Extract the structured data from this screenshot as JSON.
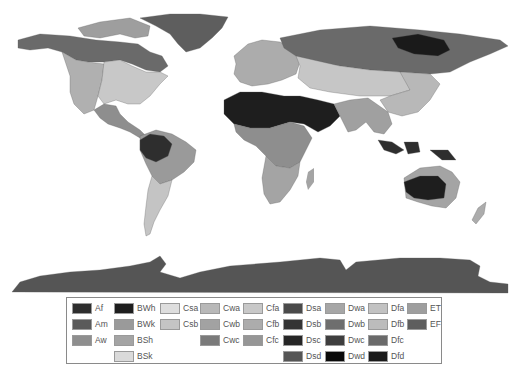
{
  "figure": {
    "caption": ""
  },
  "legend": {
    "columns": [
      [
        {
          "code": "Af",
          "color": "#2e2e2e"
        },
        {
          "code": "Am",
          "color": "#5a5a5a"
        },
        {
          "code": "Aw",
          "color": "#8e8e8e"
        }
      ],
      [
        {
          "code": "BWh",
          "color": "#1e1e1e"
        },
        {
          "code": "BWk",
          "color": "#9a9a9a"
        },
        {
          "code": "BSh",
          "color": "#a4a4a4"
        },
        {
          "code": "BSk",
          "color": "#dadada"
        }
      ],
      [
        {
          "code": "Csa",
          "color": "#dedede"
        },
        {
          "code": "Csb",
          "color": "#c4c4c4"
        }
      ],
      [
        {
          "code": "Cwa",
          "color": "#b8b8b8"
        },
        {
          "code": "Cwb",
          "color": "#a2a2a2"
        },
        {
          "code": "Cwc",
          "color": "#7a7a7a"
        }
      ],
      [
        {
          "code": "Cfa",
          "color": "#c8c8c8"
        },
        {
          "code": "Cfb",
          "color": "#acacac"
        },
        {
          "code": "Cfc",
          "color": "#969696"
        }
      ],
      [
        {
          "code": "Dsa",
          "color": "#4a4a4a"
        },
        {
          "code": "Dsb",
          "color": "#343434"
        },
        {
          "code": "Dsc",
          "color": "#262626"
        },
        {
          "code": "Dsd",
          "color": "#565656"
        }
      ],
      [
        {
          "code": "Dwa",
          "color": "#a6a6a6"
        },
        {
          "code": "Dwb",
          "color": "#6e6e6e"
        },
        {
          "code": "Dwc",
          "color": "#3e3e3e"
        },
        {
          "code": "Dwd",
          "color": "#0a0a0a"
        }
      ],
      [
        {
          "code": "Dfa",
          "color": "#c2c2c2"
        },
        {
          "code": "Dfb",
          "color": "#bcbcbc"
        },
        {
          "code": "Dfc",
          "color": "#6a6a6a"
        },
        {
          "code": "Dfd",
          "color": "#1a1a1a"
        }
      ],
      [
        {
          "code": "ET",
          "color": "#9e9e9e"
        },
        {
          "code": "EF",
          "color": "#5e5e5e"
        }
      ]
    ]
  },
  "regions": [
    {
      "name": "greenland",
      "class": "EF",
      "color": "#5e5e5e"
    },
    {
      "name": "antarctica",
      "class": "EF",
      "color": "#555555"
    },
    {
      "name": "north-america-boreal",
      "class": "Dfc",
      "color": "#6a6a6a"
    },
    {
      "name": "north-america-arctic",
      "class": "ET",
      "color": "#9e9e9e"
    },
    {
      "name": "north-america-east",
      "class": "Cfa",
      "color": "#c8c8c8"
    },
    {
      "name": "north-america-west",
      "class": "BSk",
      "color": "#b0b0b0"
    },
    {
      "name": "central-america",
      "class": "Aw",
      "color": "#8e8e8e"
    },
    {
      "name": "south-america-amazon",
      "class": "Af",
      "color": "#2e2e2e"
    },
    {
      "name": "south-america-savanna",
      "class": "Aw",
      "color": "#9a9a9a"
    },
    {
      "name": "south-america-south",
      "class": "Cfa",
      "color": "#c4c4c4"
    },
    {
      "name": "europe",
      "class": "Cfb",
      "color": "#acacac"
    },
    {
      "name": "siberia",
      "class": "Dfc",
      "color": "#6a6a6a"
    },
    {
      "name": "siberia-east",
      "class": "Dfd",
      "color": "#1a1a1a"
    },
    {
      "name": "asia-central",
      "class": "BSk",
      "color": "#c6c6c6"
    },
    {
      "name": "east-asia",
      "class": "Cwa",
      "color": "#b8b8b8"
    },
    {
      "name": "sahara-arabia",
      "class": "BWh",
      "color": "#1e1e1e"
    },
    {
      "name": "africa-tropical",
      "class": "Aw",
      "color": "#8e8e8e"
    },
    {
      "name": "africa-south",
      "class": "BSh",
      "color": "#a4a4a4"
    },
    {
      "name": "india-se-asia",
      "class": "Aw",
      "color": "#a0a0a0"
    },
    {
      "name": "indonesia",
      "class": "Af",
      "color": "#2e2e2e"
    },
    {
      "name": "australia-interior",
      "class": "BWh",
      "color": "#1e1e1e"
    },
    {
      "name": "australia-rim",
      "class": "BSh",
      "color": "#a4a4a4"
    },
    {
      "name": "new-zealand",
      "class": "Cfb",
      "color": "#acacac"
    }
  ]
}
